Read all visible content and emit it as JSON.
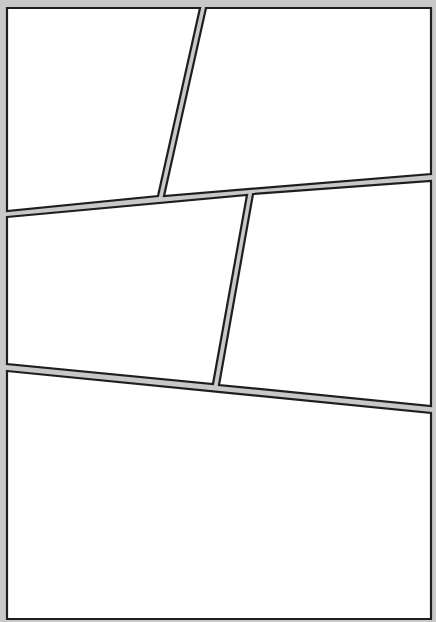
{
  "page": {
    "background": "#c8c8c8",
    "panel_fill": "#ffffff",
    "panel_border": "#1e1e1e"
  },
  "panels": [
    {
      "id": "panel-1",
      "points": "7,8 200,8 158,196 7,211"
    },
    {
      "id": "panel-2",
      "points": "206,8 431,8 431,174 164,196"
    },
    {
      "id": "panel-3",
      "points": "7,217 247,195 213,384 7,364"
    },
    {
      "id": "panel-4",
      "points": "253,194 431,181 431,406 219,385"
    },
    {
      "id": "panel-5",
      "points": "7,371 431,413 431,619 7,619"
    }
  ]
}
